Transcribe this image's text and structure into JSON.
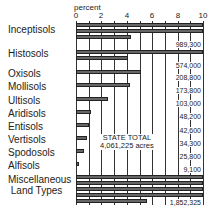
{
  "chart_data": {
    "type": "bar",
    "title": "",
    "xlabel": "percent",
    "ylabel": "",
    "xlim": [
      0,
      10
    ],
    "xticks": [
      "0",
      "2",
      "4",
      "6",
      "8",
      "10"
    ],
    "grid": true,
    "orientation": "horizontal",
    "note": "Bars longer than 10% wrap onto additional rows",
    "annotation": {
      "line1": "STATE TOTAL",
      "line2": "4,061,225 acres"
    },
    "categories": [
      "Inceptisols",
      "Histosols",
      "Oxisols",
      "Mollisols",
      "Ultisols",
      "Aridisols",
      "Entisols",
      "Vertisols",
      "Spodosols",
      "Alfisols",
      "Miscellaneous Land Types"
    ],
    "values": [
      24.36,
      14.13,
      5.14,
      4.28,
      2.54,
      1.19,
      1.05,
      0.84,
      0.64,
      0.22,
      45.61
    ],
    "acres": [
      "989,300",
      "574,000",
      "208,800",
      "173,800",
      "103,000",
      "48,200",
      "42,600",
      "34,300",
      "25,800",
      "9,100",
      "1,852,325"
    ]
  },
  "labels": {
    "axis_title": "percent",
    "ticks": [
      "0",
      "2",
      "4",
      "6",
      "8",
      "10"
    ],
    "rows": [
      {
        "name": "Inceptisols",
        "acres": "989,300"
      },
      {
        "name": "Histosols",
        "acres": "574,000"
      },
      {
        "name": "Oxisols",
        "acres": "208,800"
      },
      {
        "name": "Mollisols",
        "acres": "173,800"
      },
      {
        "name": "Ultisols",
        "acres": "103,000"
      },
      {
        "name": "Aridisols",
        "acres": "48,200"
      },
      {
        "name": "Entisols",
        "acres": "42,600"
      },
      {
        "name": "Vertisols",
        "acres": "34,300"
      },
      {
        "name": "Spodosols",
        "acres": "25,800"
      },
      {
        "name": "Alfisols",
        "acres": "9,100"
      },
      {
        "name": "Miscellaneous\n Land Types",
        "acres": "1,852,325"
      }
    ],
    "total_line1": "STATE TOTAL",
    "total_line2": "4,061,225 acres"
  }
}
